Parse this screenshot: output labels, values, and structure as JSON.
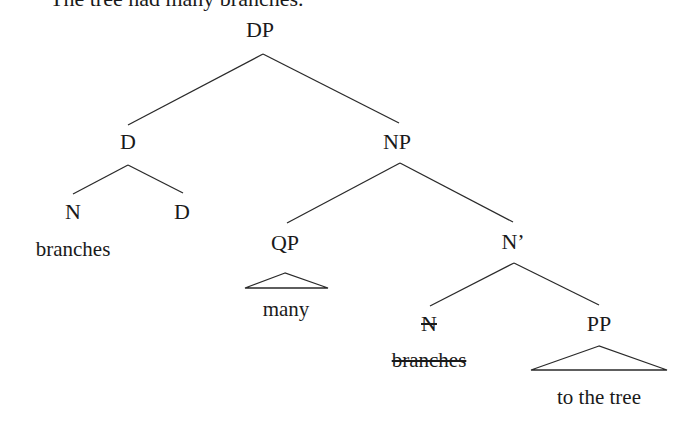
{
  "caption": "The tree had many branches.",
  "tree": {
    "nodes": {
      "dp": {
        "label": "DP",
        "x": 260,
        "y": 19
      },
      "d_top": {
        "label": "D",
        "x": 128,
        "y": 131
      },
      "np": {
        "label": "NP",
        "x": 397,
        "y": 131
      },
      "n_left": {
        "label": "N",
        "x": 73,
        "y": 201
      },
      "d_low": {
        "label": "D",
        "x": 182,
        "y": 201
      },
      "branches_left": {
        "label": "branches",
        "x": 73,
        "y": 238
      },
      "qp": {
        "label": "QP",
        "x": 285,
        "y": 232
      },
      "n_bar": {
        "label": "N’",
        "x": 513,
        "y": 231
      },
      "many": {
        "label": "many",
        "x": 286,
        "y": 298
      },
      "n_struck": {
        "label": "N",
        "x": 429,
        "y": 313
      },
      "pp": {
        "label": "PP",
        "x": 599,
        "y": 313
      },
      "branches_struck": {
        "label": "branches",
        "x": 429,
        "y": 349
      },
      "to_the_tree": {
        "label": "to the tree",
        "x": 599,
        "y": 386
      }
    },
    "edges": [
      {
        "from": "dp",
        "to": "d_top",
        "x1": 263,
        "y1": 54,
        "x2": 128,
        "y2": 125
      },
      {
        "from": "dp",
        "to": "np",
        "x1": 263,
        "y1": 54,
        "x2": 399,
        "y2": 123
      },
      {
        "from": "d_top",
        "to": "n_left",
        "x1": 128,
        "y1": 165,
        "x2": 73,
        "y2": 194
      },
      {
        "from": "d_top",
        "to": "d_low",
        "x1": 128,
        "y1": 165,
        "x2": 183,
        "y2": 193
      },
      {
        "from": "np",
        "to": "qp",
        "x1": 400,
        "y1": 163,
        "x2": 287,
        "y2": 223
      },
      {
        "from": "np",
        "to": "n_bar",
        "x1": 400,
        "y1": 163,
        "x2": 513,
        "y2": 222
      },
      {
        "from": "n_bar",
        "to": "n_struck",
        "x1": 514,
        "y1": 263,
        "x2": 430,
        "y2": 306
      },
      {
        "from": "n_bar",
        "to": "pp",
        "x1": 514,
        "y1": 263,
        "x2": 599,
        "y2": 305
      }
    ],
    "triangles": [
      {
        "node": "qp",
        "apex_x": 285,
        "apex_y": 273,
        "left_x": 245,
        "right_x": 328,
        "base_y": 288
      },
      {
        "node": "pp",
        "apex_x": 599,
        "apex_y": 346,
        "left_x": 531,
        "right_x": 667,
        "base_y": 370
      }
    ],
    "deleted_nodes": [
      "n_struck",
      "branches_struck"
    ]
  }
}
